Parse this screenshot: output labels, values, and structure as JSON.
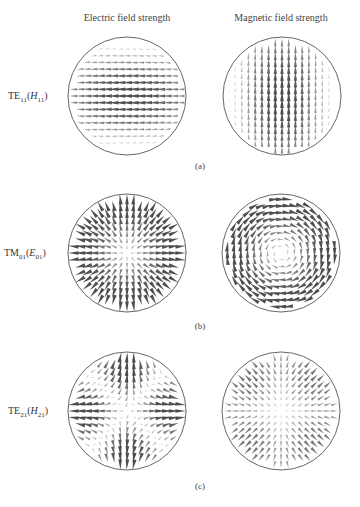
{
  "columns": {
    "left_title": "Electric field strength",
    "right_title": "Magnetic field strength"
  },
  "rows": [
    {
      "id": "a",
      "mode_prefix": "TE",
      "mode_sub": "11",
      "alt_prefix": "H",
      "alt_sub": "11",
      "panel_label": "(a)",
      "electric_pattern": "TE11-E: horizontal arrows pointing left, strongest at center",
      "magnetic_pattern": "TE11-H: vertical arrows pointing up, strongest at center"
    },
    {
      "id": "b",
      "mode_prefix": "TM",
      "mode_sub": "01",
      "alt_prefix": "E",
      "alt_sub": "01",
      "panel_label": "(b)",
      "electric_pattern": "TM01-E: radial arrows, strongest near rim",
      "magnetic_pattern": "TM01-H: circulating (azimuthal) arrows, strongest near rim"
    },
    {
      "id": "c",
      "mode_prefix": "TE",
      "mode_sub": "21",
      "alt_prefix": "H",
      "alt_sub": "21",
      "panel_label": "(c)",
      "electric_pattern": "TE21-E: four-lobe quadrupole pattern",
      "magnetic_pattern": "TE21-H: quadrupole pattern, rotated"
    }
  ],
  "colors": {
    "circle_stroke": "#555555",
    "arrow": "#444444",
    "text": "#333333"
  }
}
